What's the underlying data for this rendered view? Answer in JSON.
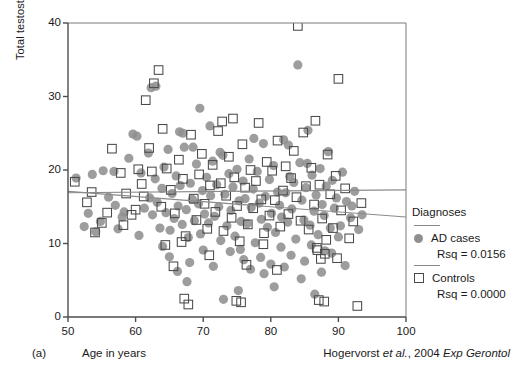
{
  "figure": {
    "panel_letter": "(a)",
    "citation_author": "Hogervorst",
    "citation_etal": "et al.",
    "citation_rest": ", 2004 ",
    "citation_journal": "Exp Gerontol"
  },
  "legend": {
    "title": "Diagnoses",
    "entries": [
      {
        "marker": "filled-circle",
        "label": "AD cases",
        "rsq": "Rsq = 0.0156"
      },
      {
        "marker": "open-square",
        "label": "Controls",
        "rsq": "Rsq = 0.0000"
      }
    ]
  },
  "colors": {
    "ad_marker": "#8f8f8f",
    "control_marker_stroke": "#4a4a4a",
    "axis": "#4d4d4d",
    "fit_line": "#8a8a8a",
    "background": "#ffffff"
  },
  "chart_data": {
    "type": "scatter",
    "title": "",
    "xlabel": "Age in years",
    "ylabel": "Total testosterone (nmol/L)",
    "xlim": [
      50,
      100
    ],
    "ylim": [
      0,
      40
    ],
    "xticks": [
      50,
      60,
      70,
      80,
      90,
      100
    ],
    "yticks": [
      0,
      10,
      20,
      30,
      40
    ],
    "grid": false,
    "legend_position": "right",
    "series": [
      {
        "name": "AD cases",
        "marker": "filled-circle",
        "color": "#8f8f8f",
        "rsq": 0.0156,
        "fit_line": {
          "x": [
            50,
            100
          ],
          "y": [
            16.9,
            17.3
          ]
        },
        "points": [
          [
            51.2,
            18.9
          ],
          [
            52.4,
            12.3
          ],
          [
            53.6,
            19.4
          ],
          [
            54.1,
            11.6
          ],
          [
            55.2,
            19.9
          ],
          [
            56.0,
            16.3
          ],
          [
            56.8,
            19.8
          ],
          [
            57.4,
            12.0
          ],
          [
            58.3,
            14.3
          ],
          [
            59.0,
            21.6
          ],
          [
            59.6,
            24.9
          ],
          [
            60.2,
            24.6
          ],
          [
            60.8,
            19.6
          ],
          [
            61.3,
            14.8
          ],
          [
            61.9,
            22.3
          ],
          [
            62.1,
            16.2
          ],
          [
            62.5,
            13.9
          ],
          [
            62.9,
            18.8
          ],
          [
            63.2,
            15.6
          ],
          [
            63.6,
            12.1
          ],
          [
            63.9,
            17.5
          ],
          [
            64.2,
            20.4
          ],
          [
            64.5,
            14.2
          ],
          [
            64.8,
            22.8
          ],
          [
            65.1,
            11.8
          ],
          [
            65.4,
            16.8
          ],
          [
            65.7,
            13.4
          ],
          [
            66.0,
            19.2
          ],
          [
            66.3,
            15.1
          ],
          [
            66.6,
            17.9
          ],
          [
            66.9,
            12.6
          ],
          [
            67.2,
            23.1
          ],
          [
            67.5,
            14.6
          ],
          [
            67.8,
            10.8
          ],
          [
            68.1,
            18.2
          ],
          [
            68.4,
            16.0
          ],
          [
            68.7,
            13.1
          ],
          [
            69.0,
            20.8
          ],
          [
            69.3,
            15.4
          ],
          [
            69.6,
            11.3
          ],
          [
            69.9,
            17.2
          ],
          [
            70.2,
            14.0
          ],
          [
            70.5,
            19.0
          ],
          [
            70.8,
            12.8
          ],
          [
            71.1,
            16.5
          ],
          [
            71.4,
            21.2
          ],
          [
            71.7,
            13.7
          ],
          [
            72.0,
            18.0
          ],
          [
            72.3,
            15.0
          ],
          [
            72.6,
            10.4
          ],
          [
            72.9,
            22.0
          ],
          [
            73.2,
            16.7
          ],
          [
            73.5,
            12.4
          ],
          [
            73.8,
            19.5
          ],
          [
            74.1,
            14.5
          ],
          [
            74.4,
            17.7
          ],
          [
            74.7,
            11.0
          ],
          [
            75.0,
            20.1
          ],
          [
            75.3,
            15.8
          ],
          [
            75.6,
            13.0
          ],
          [
            75.9,
            18.5
          ],
          [
            76.2,
            16.1
          ],
          [
            76.5,
            12.7
          ],
          [
            76.8,
            21.5
          ],
          [
            77.1,
            14.9
          ],
          [
            77.4,
            17.4
          ],
          [
            77.7,
            10.1
          ],
          [
            78.0,
            19.8
          ],
          [
            78.3,
            15.5
          ],
          [
            78.6,
            13.3
          ],
          [
            78.9,
            23.6
          ],
          [
            79.2,
            16.4
          ],
          [
            79.5,
            12.2
          ],
          [
            79.8,
            18.7
          ],
          [
            80.1,
            14.1
          ],
          [
            80.4,
            20.6
          ],
          [
            80.7,
            11.5
          ],
          [
            81.0,
            17.0
          ],
          [
            81.3,
            15.2
          ],
          [
            81.6,
            13.6
          ],
          [
            81.9,
            24.1
          ],
          [
            82.2,
            16.9
          ],
          [
            82.5,
            12.9
          ],
          [
            82.8,
            19.1
          ],
          [
            83.1,
            14.7
          ],
          [
            83.4,
            18.3
          ],
          [
            83.7,
            10.6
          ],
          [
            84.0,
            34.3
          ],
          [
            84.3,
            21.0
          ],
          [
            84.6,
            15.9
          ],
          [
            84.9,
            13.2
          ],
          [
            85.2,
            17.6
          ],
          [
            85.5,
            25.4
          ],
          [
            85.8,
            12.5
          ],
          [
            86.1,
            19.3
          ],
          [
            86.4,
            14.4
          ],
          [
            86.7,
            16.6
          ],
          [
            87.0,
            11.2
          ],
          [
            87.3,
            20.2
          ],
          [
            87.6,
            15.3
          ],
          [
            87.9,
            13.8
          ],
          [
            88.2,
            17.8
          ],
          [
            88.5,
            22.5
          ],
          [
            88.8,
            12.1
          ],
          [
            89.1,
            18.6
          ],
          [
            89.4,
            14.8
          ],
          [
            89.7,
            16.2
          ],
          [
            90.0,
            10.9
          ],
          [
            90.6,
            19.7
          ],
          [
            91.2,
            15.7
          ],
          [
            91.8,
            13.5
          ],
          [
            92.4,
            17.1
          ],
          [
            93.0,
            11.9
          ],
          [
            62.3,
            31.2
          ],
          [
            63.0,
            31.4
          ],
          [
            66.5,
            25.2
          ],
          [
            67.0,
            25.0
          ],
          [
            68.5,
            23.1
          ],
          [
            72.5,
            22.4
          ],
          [
            74.0,
            8.9
          ],
          [
            75.5,
            9.2
          ],
          [
            76.0,
            7.8
          ],
          [
            77.0,
            6.5
          ],
          [
            78.5,
            8.1
          ],
          [
            79.0,
            5.9
          ],
          [
            80.0,
            7.2
          ],
          [
            81.5,
            9.5
          ],
          [
            82.0,
            6.8
          ],
          [
            83.0,
            8.4
          ],
          [
            84.5,
            5.2
          ],
          [
            85.0,
            7.6
          ],
          [
            86.0,
            9.8
          ],
          [
            87.5,
            6.1
          ],
          [
            89.0,
            8.7
          ],
          [
            91.0,
            7.0
          ],
          [
            73.0,
            2.4
          ],
          [
            75.2,
            3.6
          ],
          [
            80.5,
            4.1
          ],
          [
            86.5,
            3.1
          ],
          [
            88.0,
            9.0
          ],
          [
            64.0,
            9.6
          ],
          [
            65.0,
            8.2
          ],
          [
            68.0,
            7.4
          ],
          [
            70.0,
            9.1
          ],
          [
            71.5,
            6.9
          ],
          [
            60.5,
            11.1
          ],
          [
            58.0,
            13.6
          ],
          [
            57.0,
            15.2
          ],
          [
            54.8,
            13.0
          ],
          [
            53.0,
            14.1
          ],
          [
            69.5,
            28.4
          ],
          [
            71.0,
            26.0
          ],
          [
            77.5,
            24.3
          ],
          [
            82.6,
            23.4
          ],
          [
            85.4,
            20.9
          ],
          [
            90.3,
            12.4
          ],
          [
            92.0,
            15.1
          ],
          [
            93.5,
            13.9
          ],
          [
            66.2,
            6.2
          ],
          [
            67.6,
            4.8
          ]
        ]
      },
      {
        "name": "Controls",
        "marker": "open-square",
        "color": "#4a4a4a",
        "rsq": 0.0,
        "fit_line": {
          "x": [
            50,
            100
          ],
          "y": [
            17.1,
            13.6
          ]
        },
        "points": [
          [
            51.0,
            18.4
          ],
          [
            52.8,
            15.6
          ],
          [
            54.0,
            11.5
          ],
          [
            55.0,
            12.8
          ],
          [
            56.5,
            22.9
          ],
          [
            57.8,
            19.6
          ],
          [
            58.6,
            16.8
          ],
          [
            59.4,
            13.9
          ],
          [
            60.0,
            14.6
          ],
          [
            60.9,
            18.1
          ],
          [
            61.5,
            29.5
          ],
          [
            62.0,
            23.0
          ],
          [
            62.7,
            31.8
          ],
          [
            63.4,
            33.6
          ],
          [
            64.0,
            25.6
          ],
          [
            64.6,
            20.2
          ],
          [
            65.2,
            17.3
          ],
          [
            65.8,
            14.1
          ],
          [
            66.4,
            21.4
          ],
          [
            67.0,
            18.8
          ],
          [
            67.4,
            11.0
          ],
          [
            67.8,
            1.7
          ],
          [
            68.2,
            24.8
          ],
          [
            68.6,
            16.1
          ],
          [
            69.0,
            13.2
          ],
          [
            69.4,
            19.4
          ],
          [
            69.8,
            22.2
          ],
          [
            70.2,
            15.4
          ],
          [
            70.6,
            12.0
          ],
          [
            71.0,
            17.9
          ],
          [
            71.4,
            20.7
          ],
          [
            71.8,
            14.3
          ],
          [
            72.2,
            25.3
          ],
          [
            72.6,
            18.2
          ],
          [
            73.0,
            11.7
          ],
          [
            73.4,
            16.5
          ],
          [
            73.8,
            21.8
          ],
          [
            74.2,
            13.5
          ],
          [
            74.6,
            19.0
          ],
          [
            75.0,
            15.1
          ],
          [
            75.4,
            10.3
          ],
          [
            75.8,
            23.5
          ],
          [
            76.2,
            17.6
          ],
          [
            76.6,
            12.6
          ],
          [
            77.0,
            20.0
          ],
          [
            77.4,
            14.8
          ],
          [
            77.8,
            18.5
          ],
          [
            78.2,
            26.4
          ],
          [
            78.6,
            16.0
          ],
          [
            79.0,
            11.4
          ],
          [
            79.4,
            21.1
          ],
          [
            79.8,
            13.8
          ],
          [
            80.2,
            19.9
          ],
          [
            80.6,
            15.9
          ],
          [
            81.0,
            24.0
          ],
          [
            81.4,
            12.3
          ],
          [
            81.8,
            17.2
          ],
          [
            82.2,
            20.5
          ],
          [
            82.6,
            14.0
          ],
          [
            83.0,
            18.9
          ],
          [
            83.4,
            22.6
          ],
          [
            83.8,
            16.3
          ],
          [
            84.0,
            39.6
          ],
          [
            84.4,
            13.1
          ],
          [
            84.8,
            25.1
          ],
          [
            85.2,
            17.8
          ],
          [
            85.6,
            11.9
          ],
          [
            86.0,
            20.3
          ],
          [
            86.4,
            15.3
          ],
          [
            86.8,
            9.4
          ],
          [
            87.2,
            18.0
          ],
          [
            87.6,
            13.4
          ],
          [
            88.0,
            8.6
          ],
          [
            88.4,
            22.1
          ],
          [
            88.8,
            16.7
          ],
          [
            89.2,
            12.1
          ],
          [
            89.6,
            19.2
          ],
          [
            90.0,
            32.4
          ],
          [
            90.4,
            14.5
          ],
          [
            91.0,
            17.5
          ],
          [
            91.6,
            10.7
          ],
          [
            92.2,
            13.0
          ],
          [
            92.8,
            1.5
          ],
          [
            93.4,
            15.5
          ],
          [
            60.4,
            20.1
          ],
          [
            63.8,
            15.0
          ],
          [
            64.4,
            9.8
          ],
          [
            65.6,
            6.9
          ],
          [
            66.8,
            10.2
          ],
          [
            70.9,
            8.4
          ],
          [
            74.9,
            2.2
          ],
          [
            75.6,
            2.0
          ],
          [
            76.4,
            7.1
          ],
          [
            78.9,
            9.9
          ],
          [
            80.9,
            6.4
          ],
          [
            87.1,
            2.3
          ],
          [
            87.9,
            2.1
          ],
          [
            53.5,
            17.0
          ],
          [
            55.8,
            14.2
          ],
          [
            58.2,
            12.5
          ],
          [
            61.2,
            16.4
          ],
          [
            62.4,
            19.8
          ],
          [
            72.8,
            26.6
          ],
          [
            74.4,
            27.0
          ],
          [
            86.6,
            26.7
          ],
          [
            67.2,
            2.5
          ],
          [
            86.9,
            9.1
          ],
          [
            87.4,
            7.9
          ],
          [
            88.2,
            10.5
          ],
          [
            89.8,
            8.0
          ]
        ]
      }
    ]
  }
}
